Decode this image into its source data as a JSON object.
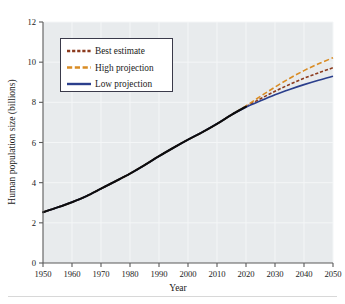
{
  "chart_data": {
    "type": "line",
    "title": "",
    "xlabel": "Year",
    "ylabel": "Human population size (billions)",
    "xlim": [
      1950,
      2050
    ],
    "ylim": [
      0,
      12
    ],
    "xticks": [
      1950,
      1960,
      1970,
      1980,
      1990,
      2000,
      2010,
      2020,
      2030,
      2040,
      2050
    ],
    "yticks": [
      0,
      2,
      4,
      6,
      8,
      10,
      12
    ],
    "grid": true,
    "legend_position": "upper-left",
    "x": [
      1950,
      1955,
      1960,
      1965,
      1970,
      1975,
      1980,
      1985,
      1990,
      1995,
      2000,
      2005,
      2010,
      2015,
      2020,
      2025,
      2030,
      2035,
      2040,
      2045,
      2050
    ],
    "series": [
      {
        "name": "Best estimate",
        "color": "#8c3b1e",
        "style": "dotted-dash",
        "values": [
          2.53,
          2.77,
          3.03,
          3.33,
          3.7,
          4.07,
          4.45,
          4.87,
          5.32,
          5.74,
          6.14,
          6.52,
          6.93,
          7.38,
          7.79,
          8.18,
          8.55,
          8.89,
          9.2,
          9.47,
          9.72
        ]
      },
      {
        "name": "High projection",
        "color": "#d98c24",
        "style": "dashed",
        "values": [
          2.53,
          2.77,
          3.03,
          3.33,
          3.7,
          4.07,
          4.45,
          4.87,
          5.32,
          5.74,
          6.14,
          6.52,
          6.93,
          7.38,
          7.82,
          8.3,
          8.76,
          9.19,
          9.58,
          9.92,
          10.22
        ]
      },
      {
        "name": "Low projection",
        "color": "#2b3f8c",
        "style": "solid",
        "values": [
          2.53,
          2.77,
          3.03,
          3.33,
          3.7,
          4.07,
          4.45,
          4.87,
          5.32,
          5.74,
          6.14,
          6.52,
          6.93,
          7.38,
          7.76,
          8.08,
          8.38,
          8.64,
          8.88,
          9.1,
          9.3
        ]
      }
    ],
    "historical_overlay": {
      "name": "Historical (all series coincident)",
      "color": "#0d0d0d",
      "x_range": [
        1950,
        2020
      ]
    }
  },
  "legend": {
    "entries": [
      {
        "label": "Best estimate"
      },
      {
        "label": "High projection"
      },
      {
        "label": "Low projection"
      }
    ]
  },
  "axes": {
    "y_title": "Human population size (billions)",
    "x_title": "Year",
    "y_tick_labels": [
      "0",
      "2",
      "4",
      "6",
      "8",
      "10",
      "12"
    ],
    "x_tick_labels": [
      "1950",
      "1960",
      "1970",
      "1980",
      "1990",
      "2000",
      "2010",
      "2020",
      "2030",
      "2040",
      "2050"
    ]
  },
  "colors": {
    "plot_background": "#e8ebed",
    "grid": "#f4f6f7",
    "axis": "#5a5a5a",
    "best_estimate": "#8c3b1e",
    "high_projection": "#d98c24",
    "low_projection": "#2b3f8c",
    "historical": "#0d0d0d"
  }
}
